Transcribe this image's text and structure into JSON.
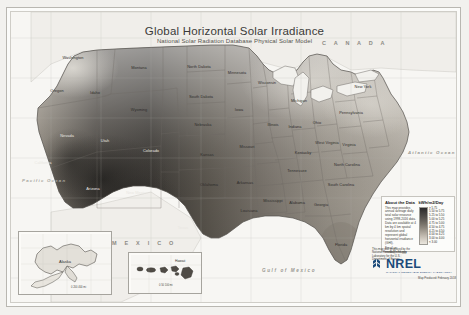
{
  "poster": {
    "title": "Global Horizontal Solar Irradiance",
    "subtitle": "National Solar Radiation Database Physical Solar Model"
  },
  "labels": {
    "canada": "C A N A D A",
    "mexico": "M E X I C O",
    "gulf_of_mexico": "Gulf of Mexico",
    "atlantic": "Atlantic Ocean",
    "pacific": "Pacific Ocean"
  },
  "states": [
    {
      "name": "Washington",
      "x": 62,
      "y": 45,
      "tone": "dark"
    },
    {
      "name": "Oregon",
      "x": 46,
      "y": 78,
      "tone": "dark"
    },
    {
      "name": "Idaho",
      "x": 84,
      "y": 80,
      "tone": "dark"
    },
    {
      "name": "Montana",
      "x": 128,
      "y": 55,
      "tone": "dark"
    },
    {
      "name": "Wyoming",
      "x": 128,
      "y": 97,
      "tone": "dark"
    },
    {
      "name": "Nevada",
      "x": 56,
      "y": 123,
      "tone": "light"
    },
    {
      "name": "Utah",
      "x": 94,
      "y": 128,
      "tone": "light"
    },
    {
      "name": "Colorado",
      "x": 140,
      "y": 138,
      "tone": "light"
    },
    {
      "name": "California",
      "x": 32,
      "y": 150,
      "tone": "light"
    },
    {
      "name": "Arizona",
      "x": 82,
      "y": 176,
      "tone": "light"
    },
    {
      "name": "New Mexico",
      "x": 126,
      "y": 180,
      "tone": "light"
    },
    {
      "name": "Texas",
      "x": 172,
      "y": 215,
      "tone": "light"
    },
    {
      "name": "North Dakota",
      "x": 188,
      "y": 54,
      "tone": "dark"
    },
    {
      "name": "South Dakota",
      "x": 190,
      "y": 84,
      "tone": "dark"
    },
    {
      "name": "Nebraska",
      "x": 192,
      "y": 112,
      "tone": "dark"
    },
    {
      "name": "Kansas",
      "x": 196,
      "y": 142,
      "tone": "dark"
    },
    {
      "name": "Oklahoma",
      "x": 198,
      "y": 172,
      "tone": "dark"
    },
    {
      "name": "Minnesota",
      "x": 226,
      "y": 60,
      "tone": "dark"
    },
    {
      "name": "Iowa",
      "x": 228,
      "y": 97,
      "tone": "dark"
    },
    {
      "name": "Missouri",
      "x": 236,
      "y": 134,
      "tone": "dark"
    },
    {
      "name": "Arkansas",
      "x": 234,
      "y": 170,
      "tone": "dark"
    },
    {
      "name": "Louisiana",
      "x": 238,
      "y": 198,
      "tone": "dark"
    },
    {
      "name": "Wisconsin",
      "x": 256,
      "y": 70,
      "tone": "dark"
    },
    {
      "name": "Illinois",
      "x": 262,
      "y": 112,
      "tone": "dark"
    },
    {
      "name": "Michigan",
      "x": 288,
      "y": 88,
      "tone": "dark"
    },
    {
      "name": "Indiana",
      "x": 284,
      "y": 114,
      "tone": "dark"
    },
    {
      "name": "Ohio",
      "x": 306,
      "y": 110,
      "tone": "dark"
    },
    {
      "name": "Kentucky",
      "x": 292,
      "y": 140,
      "tone": "dark"
    },
    {
      "name": "Tennessee",
      "x": 286,
      "y": 158,
      "tone": "dark"
    },
    {
      "name": "Mississippi",
      "x": 262,
      "y": 188,
      "tone": "dark"
    },
    {
      "name": "Alabama",
      "x": 286,
      "y": 190,
      "tone": "dark"
    },
    {
      "name": "Georgia",
      "x": 310,
      "y": 192,
      "tone": "dark"
    },
    {
      "name": "Florida",
      "x": 330,
      "y": 232,
      "tone": "dark"
    },
    {
      "name": "South Carolina",
      "x": 330,
      "y": 172,
      "tone": "dark"
    },
    {
      "name": "North Carolina",
      "x": 336,
      "y": 152,
      "tone": "dark"
    },
    {
      "name": "Virginia",
      "x": 338,
      "y": 132,
      "tone": "dark"
    },
    {
      "name": "West Virginia",
      "x": 316,
      "y": 130,
      "tone": "dark"
    },
    {
      "name": "Pennsylvania",
      "x": 340,
      "y": 100,
      "tone": "dark"
    },
    {
      "name": "New York",
      "x": 352,
      "y": 74,
      "tone": "dark"
    }
  ],
  "info_box": {
    "heading": "About the Data",
    "body": "This map provides annual average daily total solar resource using 1998-2016 data. Data are available at 4 km by 4 km spatial resolution and represent global horizontal irradiance (GHI).",
    "link_label": "Email us:",
    "link_text": "nsrdb@nrel.gov",
    "scale_title": "kWh/m2/Day",
    "scale_ticks": [
      "> 5.75",
      "5.50 to 5.75",
      "5.25 to 5.50",
      "5.00 to 5.25",
      "4.75 to 5.00",
      "4.50 to 4.75",
      "4.25 to 4.50",
      "4.00 to 4.25",
      "3.00 to 4.00",
      "< 3.00"
    ]
  },
  "insets": {
    "alaska": {
      "title": "Alaska",
      "scale": "0   200   400 mi"
    },
    "hawaii": {
      "title": "Hawaii",
      "scale": "0   50   100 mi"
    }
  },
  "branding": {
    "logo_word": "NREL",
    "logo_tagline": "NATIONAL RENEWABLE ENERGY LABORATORY",
    "caption": "Map Produced: February 2018"
  },
  "credits": {
    "line1": "This map was produced by the",
    "line2": "National Renewable Energy",
    "line3": "Laboratory for the U.S.",
    "line4": "Department of Energy."
  },
  "colors": {
    "accent": "#1b4a7a",
    "paper": "#fbfbf9",
    "frame": "#b9b7b1",
    "ramp_high": "#2b2b2b",
    "ramp_low": "#eae6de"
  }
}
